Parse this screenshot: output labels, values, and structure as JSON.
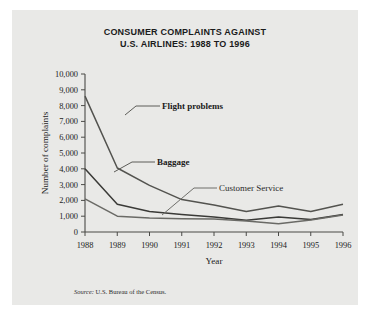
{
  "figure": {
    "title_line1": "CONSUMER COMPLAINTS AGAINST",
    "title_line2": "U.S. AIRLINES: 1988 TO 1996",
    "source_prefix": "Source:",
    "source_text": "U.S. Bureau of the Census.",
    "panel_background": "#e9e9e7",
    "page_background": "#ffffff"
  },
  "chart_data": {
    "type": "line",
    "title": "CONSUMER COMPLAINTS AGAINST U.S. AIRLINES: 1988 TO 1996",
    "xlabel": "Year",
    "ylabel": "Number of complaints",
    "categories": [
      "1988",
      "1989",
      "1990",
      "1991",
      "1992",
      "1993",
      "1994",
      "1995",
      "1996"
    ],
    "x": [
      1988,
      1989,
      1990,
      1991,
      1992,
      1993,
      1994,
      1995,
      1996
    ],
    "xlim": [
      1988,
      1996
    ],
    "ylim": [
      0,
      10000
    ],
    "ytick_labels": [
      "0",
      "1,000",
      "2,000",
      "3,000",
      "4,000",
      "5,000",
      "6,000",
      "7,000",
      "8,000",
      "9,000",
      "10,000"
    ],
    "ytick_values": [
      0,
      1000,
      2000,
      3000,
      4000,
      5000,
      6000,
      7000,
      8000,
      9000,
      10000
    ],
    "grid": false,
    "legend": "inline-annotations",
    "series": [
      {
        "name": "Flight problems",
        "color": "#53534f",
        "values": [
          8600,
          4050,
          2950,
          2050,
          1700,
          1300,
          1650,
          1300,
          1750
        ]
      },
      {
        "name": "Baggage",
        "color": "#3a3a37",
        "values": [
          4000,
          1750,
          1300,
          1100,
          950,
          750,
          950,
          800,
          1100
        ]
      },
      {
        "name": "Customer Service",
        "color": "#6a6a66",
        "values": [
          2100,
          1000,
          880,
          840,
          820,
          700,
          520,
          760,
          1080
        ]
      }
    ]
  },
  "annotations": {
    "flight_problems": "Flight problems",
    "baggage": "Baggage",
    "customer_service": "Customer Service"
  }
}
